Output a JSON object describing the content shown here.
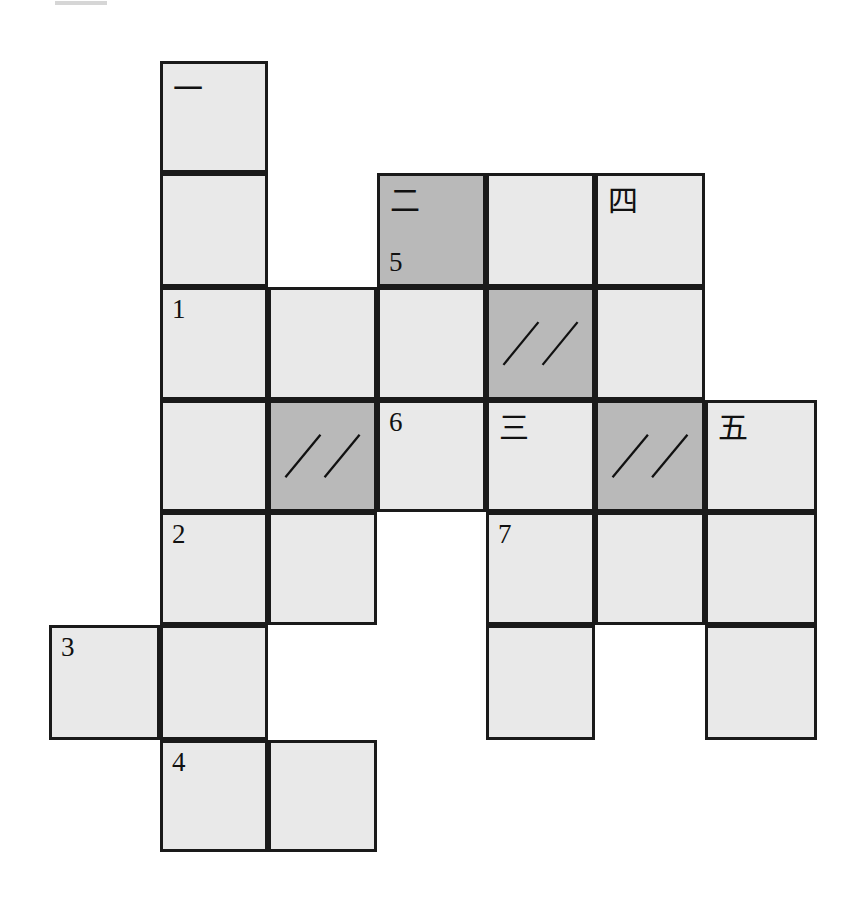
{
  "page": {
    "kind": "net-diagram-worksheet",
    "background_color": "#ffffff",
    "cell_fill_light": "#e9e9e9",
    "cell_fill_dark": "#b9b9b9",
    "border_color": "#1a1a1a",
    "top_smudge_color": "#d6d6d6"
  },
  "grid": {
    "columns_x": [
      49,
      160,
      268,
      377,
      486,
      595,
      705,
      817
    ],
    "rows_y": [
      61,
      173,
      287,
      400,
      512,
      625,
      740,
      852
    ],
    "column_count": 7,
    "row_count": 7
  },
  "cells": [
    {
      "id": "c1",
      "col": 1,
      "row": 0,
      "shaded": false,
      "label": "",
      "han": "一",
      "hatch": false
    },
    {
      "id": "c2",
      "col": 1,
      "row": 1,
      "shaded": false,
      "label": "",
      "han": "",
      "hatch": false
    },
    {
      "id": "c3",
      "col": 3,
      "row": 1,
      "shaded": true,
      "label": "5",
      "han": "二",
      "hatch": false
    },
    {
      "id": "c4",
      "col": 4,
      "row": 1,
      "shaded": false,
      "label": "",
      "han": "",
      "hatch": false
    },
    {
      "id": "c5",
      "col": 5,
      "row": 1,
      "shaded": false,
      "label": "",
      "han": "四",
      "hatch": false
    },
    {
      "id": "c6",
      "col": 1,
      "row": 2,
      "shaded": false,
      "label": "1",
      "han": "",
      "hatch": false
    },
    {
      "id": "c7",
      "col": 2,
      "row": 2,
      "shaded": false,
      "label": "",
      "han": "",
      "hatch": false
    },
    {
      "id": "c8",
      "col": 3,
      "row": 2,
      "shaded": false,
      "label": "",
      "han": "",
      "hatch": false
    },
    {
      "id": "c9",
      "col": 4,
      "row": 2,
      "shaded": true,
      "label": "",
      "han": "",
      "hatch": true
    },
    {
      "id": "c10",
      "col": 5,
      "row": 2,
      "shaded": false,
      "label": "",
      "han": "",
      "hatch": false
    },
    {
      "id": "c11",
      "col": 1,
      "row": 3,
      "shaded": false,
      "label": "",
      "han": "",
      "hatch": false
    },
    {
      "id": "c12",
      "col": 2,
      "row": 3,
      "shaded": true,
      "label": "",
      "han": "",
      "hatch": true
    },
    {
      "id": "c13",
      "col": 3,
      "row": 3,
      "shaded": false,
      "label": "6",
      "han": "",
      "hatch": false
    },
    {
      "id": "c14",
      "col": 4,
      "row": 3,
      "shaded": false,
      "label": "",
      "han": "三",
      "hatch": false
    },
    {
      "id": "c15",
      "col": 5,
      "row": 3,
      "shaded": true,
      "label": "",
      "han": "",
      "hatch": true
    },
    {
      "id": "c16",
      "col": 6,
      "row": 3,
      "shaded": false,
      "label": "",
      "han": "五",
      "hatch": false
    },
    {
      "id": "c17",
      "col": 1,
      "row": 4,
      "shaded": false,
      "label": "2",
      "han": "",
      "hatch": false
    },
    {
      "id": "c18",
      "col": 2,
      "row": 4,
      "shaded": false,
      "label": "",
      "han": "",
      "hatch": false
    },
    {
      "id": "c19",
      "col": 4,
      "row": 4,
      "shaded": false,
      "label": "7",
      "han": "",
      "hatch": false
    },
    {
      "id": "c20",
      "col": 5,
      "row": 4,
      "shaded": false,
      "label": "",
      "han": "",
      "hatch": false
    },
    {
      "id": "c21",
      "col": 6,
      "row": 4,
      "shaded": false,
      "label": "",
      "han": "",
      "hatch": false
    },
    {
      "id": "c22",
      "col": 0,
      "row": 5,
      "shaded": false,
      "label": "3",
      "han": "",
      "hatch": false
    },
    {
      "id": "c23",
      "col": 1,
      "row": 5,
      "shaded": false,
      "label": "",
      "han": "",
      "hatch": false
    },
    {
      "id": "c24",
      "col": 4,
      "row": 5,
      "shaded": false,
      "label": "",
      "han": "",
      "hatch": false
    },
    {
      "id": "c25",
      "col": 6,
      "row": 5,
      "shaded": false,
      "label": "",
      "han": "",
      "hatch": false
    },
    {
      "id": "c26",
      "col": 1,
      "row": 6,
      "shaded": false,
      "label": "4",
      "han": "",
      "hatch": false
    },
    {
      "id": "c27",
      "col": 2,
      "row": 6,
      "shaded": false,
      "label": "",
      "han": "",
      "hatch": false
    }
  ],
  "legend": {
    "numbers": [
      "1",
      "2",
      "3",
      "4",
      "5",
      "6",
      "7"
    ],
    "han_numerals": [
      "一",
      "二",
      "三",
      "四",
      "五"
    ],
    "hatch_mark": "//"
  }
}
